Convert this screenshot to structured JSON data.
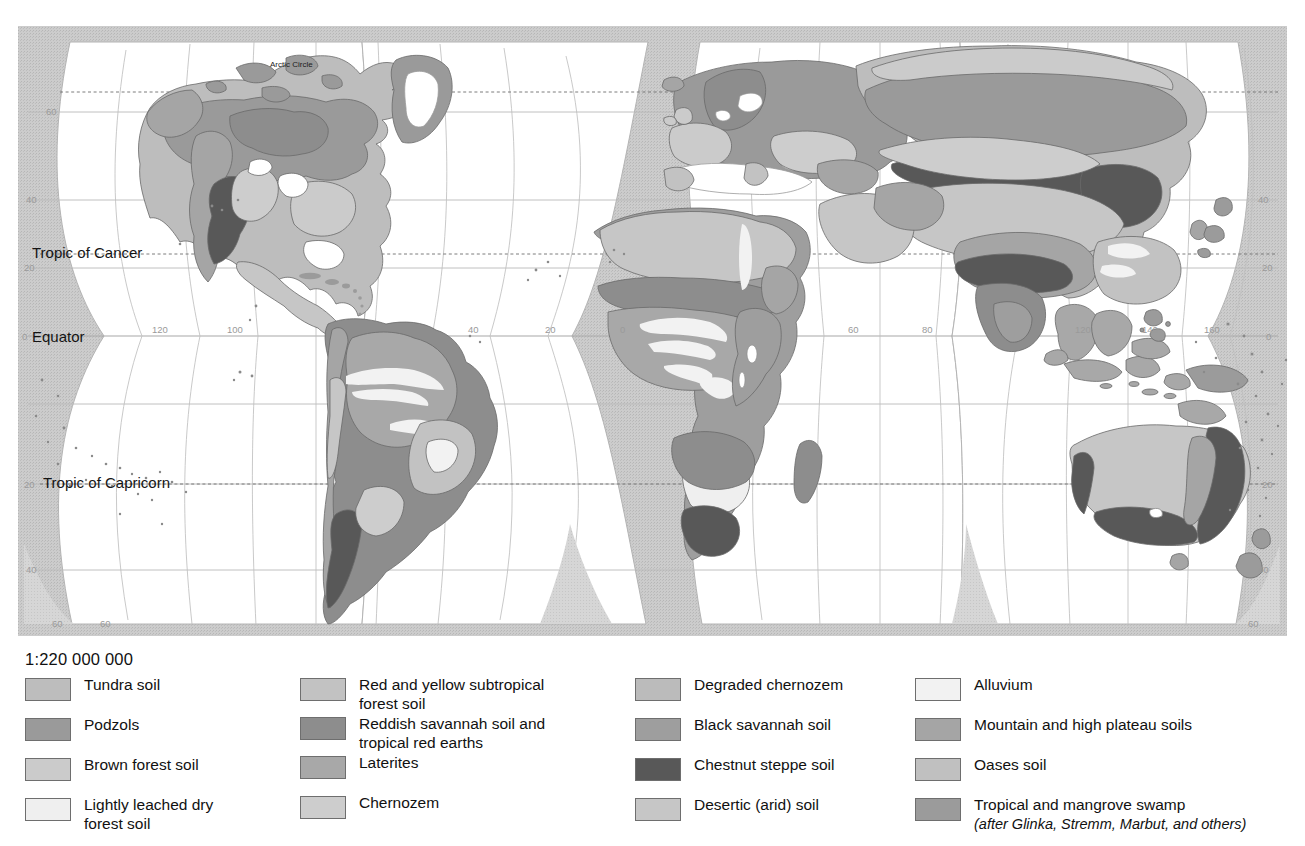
{
  "map": {
    "title": "World Soils",
    "scale": "1:220 000 000",
    "projection": "interrupted homolosine",
    "named_lines": [
      {
        "id": "arctic-circle",
        "label": "Arctic Circle"
      },
      {
        "id": "tropic-of-cancer",
        "label": "Tropic of Cancer"
      },
      {
        "id": "equator",
        "label": "Equator"
      },
      {
        "id": "tropic-of-capricorn",
        "label": "Tropic of Capricorn"
      }
    ],
    "latitude_labels_left": [
      "60",
      "40",
      "20",
      "0",
      "20",
      "40",
      "60"
    ],
    "latitude_labels_right": [
      "40",
      "20",
      "0",
      "20",
      "40",
      "60"
    ],
    "longitude_labels_west": [
      "120",
      "100",
      "40",
      "20",
      "0"
    ],
    "longitude_labels_east": [
      "60",
      "80",
      "120",
      "140",
      "160"
    ],
    "ocean_color": "#ffffff",
    "outer_fill_color": "#c9c9c9",
    "graticule_color": "#b4b4b4",
    "coast_color": "#5a5a5a"
  },
  "legend": {
    "scale_label": "1:220 000 000",
    "attribution": "(after Glinka, Stremm, Marbut, and others)",
    "columns": [
      {
        "id": "col-1",
        "items": [
          {
            "label": "Tundra soil",
            "label_line2": "",
            "color": "#bdbdbd"
          },
          {
            "label": "Podzols",
            "label_line2": "",
            "color": "#9a9a9a"
          },
          {
            "label": "Brown forest soil",
            "label_line2": "",
            "color": "#cbcbcb"
          },
          {
            "label": "Lightly leached dry",
            "label_line2": "forest soil",
            "color": "#efefef"
          }
        ]
      },
      {
        "id": "col-2",
        "items": [
          {
            "label": "Red and yellow subtropical",
            "label_line2": "forest soil",
            "color": "#c2c2c2"
          },
          {
            "label": "Reddish savannah soil and",
            "label_line2": "tropical red earths",
            "color": "#8d8d8d"
          },
          {
            "label": "Laterites",
            "label_line2": "",
            "color": "#a8a8a8"
          },
          {
            "label": "Chernozem",
            "label_line2": "",
            "color": "#cdcdcd"
          }
        ]
      },
      {
        "id": "col-3",
        "items": [
          {
            "label": "Degraded chernozem",
            "label_line2": "",
            "color": "#bbbbbb"
          },
          {
            "label": "Black savannah soil",
            "label_line2": "",
            "color": "#9e9e9e"
          },
          {
            "label": "Chestnut steppe soil",
            "label_line2": "",
            "color": "#585858"
          },
          {
            "label": "Desertic (arid) soil",
            "label_line2": "",
            "color": "#c6c6c6"
          }
        ]
      },
      {
        "id": "col-4",
        "items": [
          {
            "label": "Alluvium",
            "label_line2": "",
            "color": "#f2f2f2"
          },
          {
            "label": "Mountain and high plateau soils",
            "label_line2": "",
            "color": "#a5a5a5"
          },
          {
            "label": "Oases soil",
            "label_line2": "",
            "color": "#c0c0c0"
          },
          {
            "label": "Tropical and mangrove swamp",
            "label_line2": "",
            "color": "#9b9b9b"
          }
        ]
      }
    ]
  }
}
